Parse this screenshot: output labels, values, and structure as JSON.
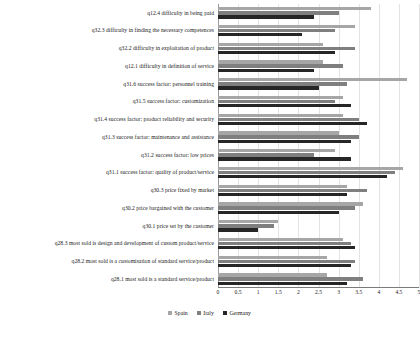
{
  "chart_data": {
    "type": "bar",
    "orientation": "horizontal",
    "title": "",
    "subtitle": "",
    "xlabel": "",
    "ylabel": "",
    "xlim": [
      0,
      5
    ],
    "grid": true,
    "legend_position": "bottom-center",
    "tick_labels": [
      "0",
      "0.5",
      "1",
      "1.5",
      "2",
      "2.5",
      "3",
      "3.5",
      "4",
      "4.5",
      "5"
    ],
    "tick_values": [
      0,
      0.5,
      1,
      1.5,
      2,
      2.5,
      3,
      3.5,
      4,
      4.5,
      5
    ],
    "categories": [
      "q12.4 difficulty in being paid",
      "q32.3 difficulty in finding the necessary competences",
      "q32.2 difficulty in exploitation of product",
      "q12.1 difficulty in definition of service",
      "q31.6 success factor: personnel training",
      "q31.5 success factor: customization",
      "q31.4 success factor: product reliability and security",
      "q31.3 success factor: maintenance and assistance",
      "q31.2 success factor: low prices",
      "q31.1 success factor: quality of product/service",
      "q30.3 price fixed by market",
      "q30.2 price bargained with the customer",
      "q30.1 price set by the customer",
      "q28.3 most sold is design and development of custom product/service",
      "q28.2 most sold is a customisation of standard service/product",
      "q28.1 most sold is a standard service/product"
    ],
    "series": [
      {
        "name": "Spain",
        "color": "#a6a6a6",
        "values": [
          3.8,
          3.4,
          2.6,
          2.6,
          4.7,
          3.1,
          3.1,
          3.0,
          2.9,
          4.6,
          3.2,
          3.6,
          1.5,
          3.1,
          2.7,
          2.7
        ]
      },
      {
        "name": "Italy",
        "color": "#7f7f7f",
        "values": [
          3.0,
          2.9,
          3.4,
          3.1,
          3.2,
          2.9,
          3.5,
          3.5,
          2.4,
          4.4,
          3.7,
          3.4,
          1.4,
          3.3,
          3.4,
          3.6
        ]
      },
      {
        "name": "Germany",
        "color": "#262626",
        "values": [
          2.4,
          2.1,
          2.9,
          2.4,
          2.5,
          3.3,
          3.7,
          3.3,
          3.3,
          4.2,
          3.2,
          3.0,
          1.0,
          3.4,
          3.3,
          3.2
        ]
      }
    ]
  },
  "legend": {
    "items": [
      {
        "label": "Spain"
      },
      {
        "label": "Italy"
      },
      {
        "label": "Germany"
      }
    ]
  }
}
